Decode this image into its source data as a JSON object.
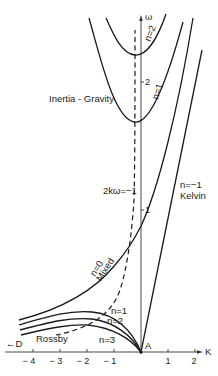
{
  "diagram": {
    "type": "dispersion-diagram",
    "axes": {
      "x_label": "K",
      "y_label": "ω",
      "x_ticks": [
        {
          "value": "− 4",
          "x": 33
        },
        {
          "value": "− 3",
          "x": 60
        },
        {
          "value": "− 2",
          "x": 87
        },
        {
          "value": "− 1",
          "x": 114
        },
        {
          "value": "1",
          "x": 168
        },
        {
          "value": "2",
          "x": 195
        }
      ],
      "y_ticks": [
        {
          "value": "2",
          "y": 82
        },
        {
          "value": "1",
          "y": 210
        }
      ],
      "origin_label": "A",
      "left_arrow_label": "←D"
    },
    "labels": {
      "inertia_gravity": "Inertia - Gravity",
      "n2_upper": "n=2",
      "n1_upper": "n=1",
      "dashed_curve": "2kω=−1",
      "kelvin_n": "n=−1",
      "kelvin": "Kelvin",
      "mixed_n": "n=0",
      "mixed": "Mixed",
      "rossby": "Rossby",
      "rossby_n1": "n=1",
      "rossby_n2": "n=2",
      "rossby_n3": "n=3"
    },
    "colors": {
      "line": "#1a1a1a",
      "axis": "#333333",
      "background": "#ffffff"
    }
  }
}
